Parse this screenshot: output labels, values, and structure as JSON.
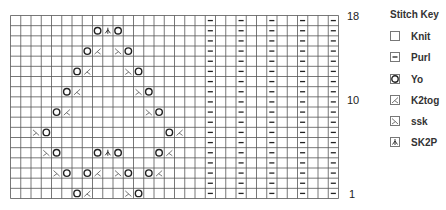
{
  "chart": {
    "columns": 32,
    "rows": 18,
    "row_labels": [
      {
        "row": 18,
        "text": "18"
      },
      {
        "row": 10,
        "text": "10"
      },
      {
        "row": 1,
        "text": "1"
      }
    ],
    "purl_columns": [
      19,
      22,
      25,
      28,
      31
    ],
    "stitches": {
      "17": [
        {
          "col": 8,
          "type": "yo"
        },
        {
          "col": 9,
          "type": "sk2p"
        },
        {
          "col": 10,
          "type": "yo"
        }
      ],
      "15": [
        {
          "col": 7,
          "type": "yo"
        },
        {
          "col": 8,
          "type": "k2tog"
        },
        {
          "col": 10,
          "type": "ssk"
        },
        {
          "col": 11,
          "type": "yo"
        }
      ],
      "13": [
        {
          "col": 6,
          "type": "yo"
        },
        {
          "col": 7,
          "type": "k2tog"
        },
        {
          "col": 11,
          "type": "ssk"
        },
        {
          "col": 12,
          "type": "yo"
        }
      ],
      "11": [
        {
          "col": 5,
          "type": "yo"
        },
        {
          "col": 6,
          "type": "k2tog"
        },
        {
          "col": 12,
          "type": "ssk"
        },
        {
          "col": 13,
          "type": "yo"
        }
      ],
      "9": [
        {
          "col": 4,
          "type": "yo"
        },
        {
          "col": 5,
          "type": "k2tog"
        },
        {
          "col": 13,
          "type": "ssk"
        },
        {
          "col": 14,
          "type": "yo"
        }
      ],
      "7": [
        {
          "col": 2,
          "type": "ssk"
        },
        {
          "col": 3,
          "type": "yo"
        },
        {
          "col": 15,
          "type": "yo"
        },
        {
          "col": 16,
          "type": "k2tog"
        }
      ],
      "5": [
        {
          "col": 3,
          "type": "ssk"
        },
        {
          "col": 4,
          "type": "yo"
        },
        {
          "col": 8,
          "type": "yo"
        },
        {
          "col": 9,
          "type": "sk2p"
        },
        {
          "col": 10,
          "type": "yo"
        },
        {
          "col": 14,
          "type": "yo"
        },
        {
          "col": 15,
          "type": "k2tog"
        }
      ],
      "3": [
        {
          "col": 4,
          "type": "ssk"
        },
        {
          "col": 5,
          "type": "yo"
        },
        {
          "col": 7,
          "type": "yo"
        },
        {
          "col": 8,
          "type": "k2tog"
        },
        {
          "col": 10,
          "type": "ssk"
        },
        {
          "col": 11,
          "type": "yo"
        },
        {
          "col": 13,
          "type": "yo"
        },
        {
          "col": 14,
          "type": "k2tog"
        }
      ],
      "1": [
        {
          "col": 6,
          "type": "yo"
        },
        {
          "col": 7,
          "type": "k2tog"
        },
        {
          "col": 11,
          "type": "ssk"
        },
        {
          "col": 12,
          "type": "yo"
        }
      ]
    }
  },
  "legend": {
    "title": "Stitch Key",
    "items": [
      {
        "type": "knit",
        "label": "Knit",
        "icon": "empty-square-icon"
      },
      {
        "type": "purl",
        "label": "Purl",
        "icon": "dash-icon"
      },
      {
        "type": "yo",
        "label": "Yo",
        "icon": "circle-icon"
      },
      {
        "type": "k2tog",
        "label": "K2tog",
        "icon": "right-slant-icon"
      },
      {
        "type": "ssk",
        "label": "ssk",
        "icon": "left-slant-icon"
      },
      {
        "type": "sk2p",
        "label": "SK2P",
        "icon": "double-decrease-icon"
      }
    ]
  },
  "colors": {
    "grid": "#555555",
    "symbol": "#222222",
    "decrease": "#666666"
  }
}
